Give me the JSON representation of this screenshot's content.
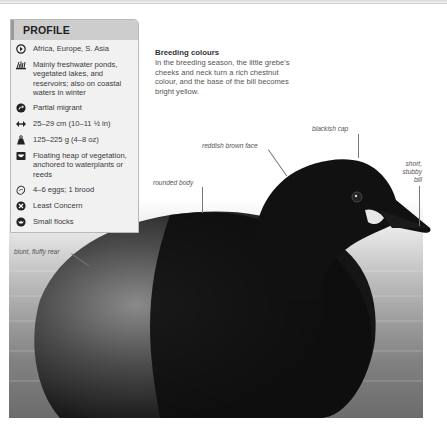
{
  "profile": {
    "title": "PROFILE",
    "items": [
      {
        "icon": "range-globe-icon",
        "text": "Africa, Europe, S. Asia"
      },
      {
        "icon": "habitat-reeds-icon",
        "text": "Mainly freshwater ponds, vegetated lakes, and reservoirs; also on coastal waters in winter"
      },
      {
        "icon": "migration-arrow-icon",
        "text": "Partial migrant"
      },
      {
        "icon": "length-arrows-icon",
        "text": "25–29 cm (10–11 ½ in)"
      },
      {
        "icon": "weight-icon",
        "text": "125–225 g (4–8 oz)"
      },
      {
        "icon": "nest-icon",
        "text": "Floating heap of vegetation, anchored to waterplants or reeds"
      },
      {
        "icon": "egg-icon",
        "text": "4–6 eggs; 1 brood"
      },
      {
        "icon": "conservation-status-icon",
        "text": "Least Concern"
      },
      {
        "icon": "flock-icon",
        "text": "Small flocks"
      }
    ]
  },
  "breeding": {
    "title": "Breeding colours",
    "text": "In the breeding season, the little grebe's cheeks and neck turn a rich chestnut colour, and the base of the bill becomes bright yellow."
  },
  "annotations": {
    "blackish_cap": "blackish cap",
    "reddish_brown_face": "reddish brown face",
    "rounded_body": "rounded body",
    "short_stubby_bill_1": "short,",
    "short_stubby_bill_2": "stubby",
    "short_stubby_bill_3": "bill",
    "blunt_fluffy_rear": "blunt, fluffy rear"
  },
  "colors": {
    "profile_header": "#cdcdcd",
    "profile_bg": "#f1f1f1",
    "profile_border": "#b9b9b9"
  }
}
